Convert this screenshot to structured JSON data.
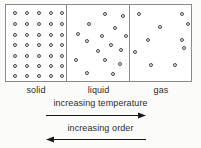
{
  "diagram": {
    "phases": [
      {
        "key": "solid",
        "label": "solid",
        "arrangement": "regular-lattice",
        "particle_count": 35,
        "grid": {
          "columns": 5,
          "rows": 7
        },
        "particles": [
          {
            "x": 7,
            "y": 6
          },
          {
            "x": 19,
            "y": 6
          },
          {
            "x": 31,
            "y": 6
          },
          {
            "x": 43,
            "y": 6
          },
          {
            "x": 54,
            "y": 6
          },
          {
            "x": 7,
            "y": 17
          },
          {
            "x": 19,
            "y": 17
          },
          {
            "x": 31,
            "y": 17
          },
          {
            "x": 43,
            "y": 17
          },
          {
            "x": 54,
            "y": 17
          },
          {
            "x": 7,
            "y": 28
          },
          {
            "x": 19,
            "y": 28
          },
          {
            "x": 31,
            "y": 28
          },
          {
            "x": 43,
            "y": 28
          },
          {
            "x": 54,
            "y": 28
          },
          {
            "x": 7,
            "y": 38
          },
          {
            "x": 19,
            "y": 38
          },
          {
            "x": 31,
            "y": 38
          },
          {
            "x": 43,
            "y": 38
          },
          {
            "x": 54,
            "y": 38
          },
          {
            "x": 7,
            "y": 49
          },
          {
            "x": 19,
            "y": 49
          },
          {
            "x": 31,
            "y": 49
          },
          {
            "x": 43,
            "y": 49
          },
          {
            "x": 54,
            "y": 49
          },
          {
            "x": 7,
            "y": 59
          },
          {
            "x": 19,
            "y": 59
          },
          {
            "x": 31,
            "y": 59
          },
          {
            "x": 43,
            "y": 59
          },
          {
            "x": 54,
            "y": 59
          },
          {
            "x": 7,
            "y": 69
          },
          {
            "x": 19,
            "y": 69
          },
          {
            "x": 31,
            "y": 69
          },
          {
            "x": 43,
            "y": 69
          },
          {
            "x": 54,
            "y": 69
          }
        ]
      },
      {
        "key": "liquid",
        "label": "liquid",
        "arrangement": "close-packed-disordered",
        "particle_count": 16,
        "particles": [
          {
            "x": 36,
            "y": 7
          },
          {
            "x": 54,
            "y": 9
          },
          {
            "x": 20,
            "y": 17
          },
          {
            "x": 46,
            "y": 21
          },
          {
            "x": 9,
            "y": 27
          },
          {
            "x": 33,
            "y": 29
          },
          {
            "x": 57,
            "y": 29
          },
          {
            "x": 18,
            "y": 34
          },
          {
            "x": 42,
            "y": 38
          },
          {
            "x": 29,
            "y": 44
          },
          {
            "x": 52,
            "y": 43
          },
          {
            "x": 7,
            "y": 53
          },
          {
            "x": 36,
            "y": 53
          },
          {
            "x": 51,
            "y": 57
          },
          {
            "x": 18,
            "y": 66
          },
          {
            "x": 44,
            "y": 67
          }
        ]
      },
      {
        "key": "gas",
        "label": "gas",
        "arrangement": "sparse-random",
        "particle_count": 10,
        "particles": [
          {
            "x": 7,
            "y": 7
          },
          {
            "x": 50,
            "y": 7
          },
          {
            "x": 28,
            "y": 20
          },
          {
            "x": 16,
            "y": 33
          },
          {
            "x": 50,
            "y": 33
          },
          {
            "x": 52,
            "y": 41
          },
          {
            "x": 3,
            "y": 45
          },
          {
            "x": 19,
            "y": 58
          },
          {
            "x": 43,
            "y": 58
          },
          {
            "x": 56,
            "y": 17
          }
        ]
      }
    ],
    "captions": {
      "temperature": "increasing temperature",
      "order": "increasing order"
    },
    "arrows": [
      {
        "name": "temperature-arrow",
        "direction": "right"
      },
      {
        "name": "order-arrow",
        "direction": "left"
      }
    ],
    "colors": {
      "background": "#fbfbfa",
      "box_fill": "#ffffff",
      "box_border": "#8b8b8b",
      "particle_stroke": "#4a4a4a",
      "particle_fill": "#e9e9e9",
      "text": "#2b2b2b",
      "arrow": "#1a1a1a"
    }
  }
}
